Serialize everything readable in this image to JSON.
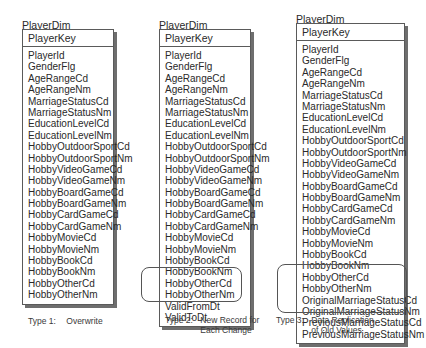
{
  "diagram": {
    "entities": [
      {
        "title": "PlayerDim",
        "key": "PlayerKey",
        "fields": [
          "PlayerId",
          "GenderFlg",
          "AgeRangeCd",
          "AgeRangeNm",
          "MarriageStatusCd",
          "MarriageStatusNm",
          "EducationLevelCd",
          "EducationLevelNm",
          "HobbyOutdoorSportCd",
          "HobbyOutdoorSportNm",
          "HobbyVideoGameCd",
          "HobbyVideoGameNm",
          "HobbyBoardGameCd",
          "HobbyBoardGameNm",
          "HobbyCardGameCd",
          "HobbyCardGameNm",
          "HobbyMovieCd",
          "HobbyMovieNm",
          "HobbyBookCd",
          "HobbyBookNm",
          "HobbyOtherCd",
          "HobbyOtherNm"
        ],
        "extra_fields": [],
        "caption": {
          "type": "Type 1:",
          "description": "Overwrite"
        }
      },
      {
        "title": "PlayerDim",
        "key": "PlayerKey",
        "fields": [
          "PlayerId",
          "GenderFlg",
          "AgeRangeCd",
          "AgeRangeNm",
          "MarriageStatusCd",
          "MarriageStatusNm",
          "EducationLevelCd",
          "EducationLevelNm",
          "HobbyOutdoorSportCd",
          "HobbyOutdoorSportNm",
          "HobbyVideoGameCd",
          "HobbyVideoGameNm",
          "HobbyBoardGameCd",
          "HobbyBoardGameNm",
          "HobbyCardGameCd",
          "HobbyCardGameNm",
          "HobbyMovieCd",
          "HobbyMovieNm",
          "HobbyBookCd",
          "HobbyBookNm",
          "HobbyOtherCd",
          "HobbyOtherNm"
        ],
        "extra_fields": [
          "ValidFromDt",
          "ValidToDt"
        ],
        "caption": {
          "type": "Type 2:",
          "description": "New Record for\nEach Change"
        }
      },
      {
        "title": "PlayerDim",
        "key": "PlayerKey",
        "fields": [
          "PlayerId",
          "GenderFlg",
          "AgeRangeCd",
          "AgeRangeNm",
          "MarriageStatusCd",
          "MarriageStatusNm",
          "EducationLevelCd",
          "EducationLevelNm",
          "HobbyOutdoorSportCd",
          "HobbyOutdoorSportNm",
          "HobbyVideoGameCd",
          "HobbyVideoGameNm",
          "HobbyBoardGameCd",
          "HobbyBoardGameNm",
          "HobbyCardGameCd",
          "HobbyCardGameNm",
          "HobbyMovieCd",
          "HobbyMovieNm",
          "HobbyBookCd",
          "HobbyBookNm",
          "HobbyOtherCd",
          "HobbyOtherNm"
        ],
        "extra_fields": [
          "OriginalMarriageStatusCd",
          "OriginalMarriageStatusNm",
          "PreviousMarriageStatusCd",
          "PreviousMarriageStatusNm"
        ],
        "caption": {
          "type": "Type 3:",
          "description": "Data Replication\nof Old Values"
        }
      }
    ]
  },
  "colors": {
    "border": "#5a5a5a",
    "shadow": "#6e6e6e",
    "text": "#2a2a2a"
  }
}
